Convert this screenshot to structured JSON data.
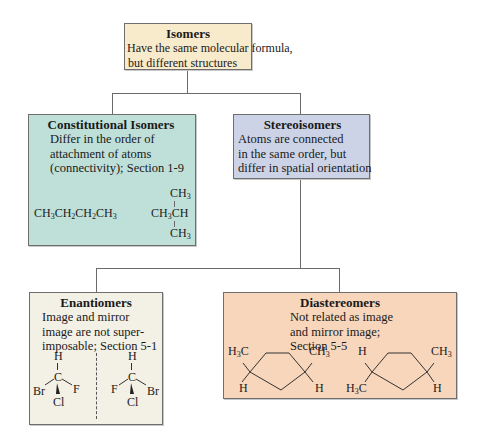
{
  "colors": {
    "isomers_bg": "#f8ebcc",
    "constitutional_bg": "#bfe0d8",
    "stereo_bg": "#cdd3e6",
    "enantiomers_bg": "#f3f0e6",
    "diastereomers_bg": "#f7d6bb",
    "connector": "#6a6a6a"
  },
  "nodes": {
    "isomers": {
      "title": "Isomers",
      "desc_lines": [
        "Have the same molecular formula,",
        "but different structures"
      ]
    },
    "constitutional": {
      "title": "Constitutional Isomers",
      "desc_lines": [
        "Differ in the order of",
        "attachment of atoms",
        "(connectivity); Section 1-9"
      ],
      "examples": {
        "butane": "CH3CH2CH2CH3",
        "isobutane": {
          "top": "CH3",
          "middle": "CH3CH",
          "bottom": "CH3"
        }
      }
    },
    "stereo": {
      "title": "Stereoisomers",
      "desc_lines": [
        "Atoms are connected",
        "in the same order, but",
        "differ in spatial orientation"
      ]
    },
    "enantiomers": {
      "title": "Enantiomers",
      "desc_lines": [
        "Image and mirror",
        "image are not super-",
        "imposable; Section 5-1"
      ],
      "molecule_left": {
        "top": "H",
        "center": "C",
        "left": "Br",
        "right": "F",
        "bottom": "Cl"
      },
      "molecule_right": {
        "top": "H",
        "center": "C",
        "left": "F",
        "right": "Br",
        "bottom": "Cl"
      }
    },
    "diastereomers": {
      "title": "Diastereomers",
      "desc_lines": [
        "Not related as image",
        "and mirror image;",
        "Section 5-5"
      ],
      "molecule_left": {
        "top_left": "H3C",
        "bottom_left": "H",
        "top_right": "CH3",
        "bottom_right": "H"
      },
      "molecule_right": {
        "top_left": "H",
        "bottom_left": "H3C",
        "top_right": "CH3",
        "bottom_right": "H"
      }
    }
  }
}
